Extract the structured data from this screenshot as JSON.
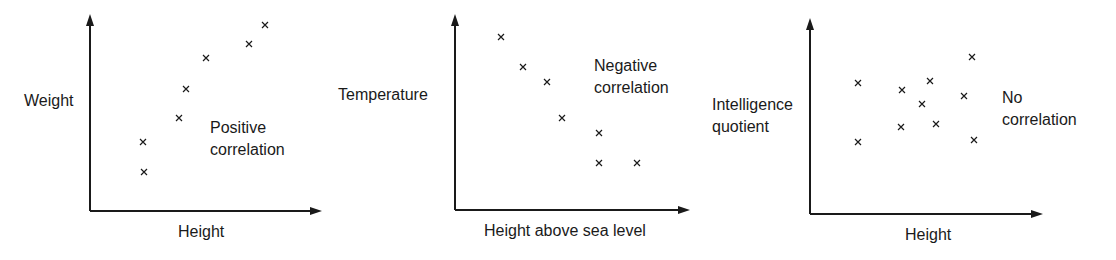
{
  "chart_data": [
    {
      "type": "scatter",
      "title": "Positive correlation",
      "xlabel": "Height",
      "ylabel": "Weight",
      "annotation": "Positive\ncorrelation",
      "grid": false,
      "ticks": false,
      "points": [
        [
          143,
          142
        ],
        [
          144,
          172
        ],
        [
          179,
          118
        ],
        [
          186,
          89
        ],
        [
          206,
          58
        ],
        [
          249,
          44
        ],
        [
          265,
          25
        ]
      ],
      "axis": {
        "origin": [
          90,
          211
        ],
        "x_end": 322,
        "y_top": 14
      }
    },
    {
      "type": "scatter",
      "title": "Negative correlation",
      "xlabel": "Height above sea level",
      "ylabel": "Temperature",
      "annotation": "Negative\ncorrelation",
      "grid": false,
      "ticks": false,
      "points": [
        [
          501,
          37
        ],
        [
          523,
          67
        ],
        [
          547,
          82
        ],
        [
          562,
          118
        ],
        [
          599,
          133
        ],
        [
          599,
          163
        ],
        [
          637,
          163
        ]
      ],
      "axis": {
        "origin": [
          455,
          210
        ],
        "x_end": 690,
        "y_top": 14
      }
    },
    {
      "type": "scatter",
      "title": "No correlation",
      "xlabel": "Height",
      "ylabel": "Intelligence\nquotient",
      "annotation": "No\ncorrelation",
      "grid": false,
      "ticks": false,
      "points": [
        [
          858,
          83
        ],
        [
          902,
          90
        ],
        [
          930,
          81
        ],
        [
          922,
          104
        ],
        [
          964,
          96
        ],
        [
          972,
          57
        ],
        [
          858,
          142
        ],
        [
          901,
          127
        ],
        [
          936,
          124
        ],
        [
          974,
          140
        ]
      ],
      "axis": {
        "origin": [
          810,
          214
        ],
        "x_end": 1043,
        "y_top": 18
      }
    }
  ],
  "labels": {
    "c1_y": "Weight",
    "c1_x": "Height",
    "c1_ann": "Positive\ncorrelation",
    "c2_y": "Temperature",
    "c2_x": "Height above sea level",
    "c2_ann": "Negative\ncorrelation",
    "c3_y": "Intelligence\nquotient",
    "c3_x": "Height",
    "c3_ann": "No\ncorrelation"
  },
  "colors": {
    "ink": "#1a1a1a",
    "background": "#ffffff"
  }
}
